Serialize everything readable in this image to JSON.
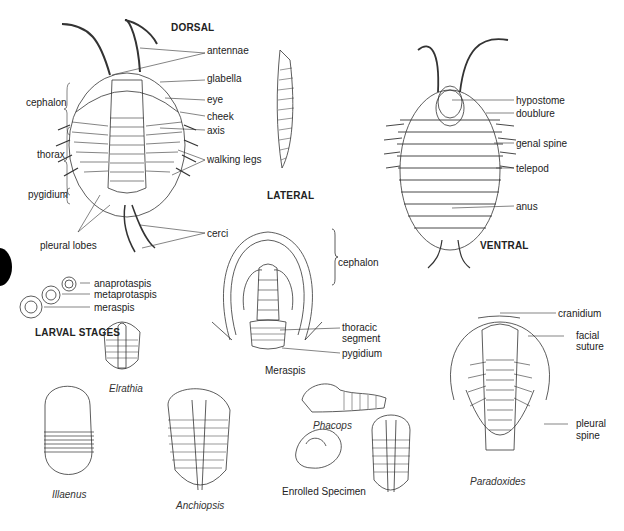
{
  "figure": {
    "headings": {
      "dorsal": "DORSAL",
      "lateral": "LATERAL",
      "ventral": "VENTRAL",
      "larval_stages": "LARVAL STAGES"
    },
    "dorsal_labels": {
      "left": [
        "cephalon",
        "thorax",
        "pygidium",
        "pleural lobes"
      ],
      "right": [
        "antennae",
        "glabella",
        "eye",
        "cheek",
        "axis",
        "walking legs",
        "cerci"
      ]
    },
    "ventral_labels": [
      "hypostome",
      "doublure",
      "genal spine",
      "telepod",
      "anus"
    ],
    "larval_labels": [
      "anaprotaspis",
      "metaprotaspis",
      "meraspis"
    ],
    "meraspis_labels": {
      "cephalon": "cephalon",
      "thoracic_segment": "thoracic segment",
      "thoracic_line1": "thoracic",
      "thoracic_line2": "segment",
      "pygidium": "pygidium",
      "caption": "Meraspis"
    },
    "paradoxides_labels": {
      "cranidium": "cranidium",
      "facial_suture_line1": "facial",
      "facial_suture_line2": "suture",
      "pleural_spine_line1": "pleural",
      "pleural_spine_line2": "spine",
      "caption": "Paradoxides"
    },
    "specimen_captions": {
      "illaenus": "Illaenus",
      "elrathia": "Elrathia",
      "anchiopsis": "Anchiopsis",
      "phacops": "Phacops",
      "enrolled": "Enrolled Specimen"
    }
  }
}
